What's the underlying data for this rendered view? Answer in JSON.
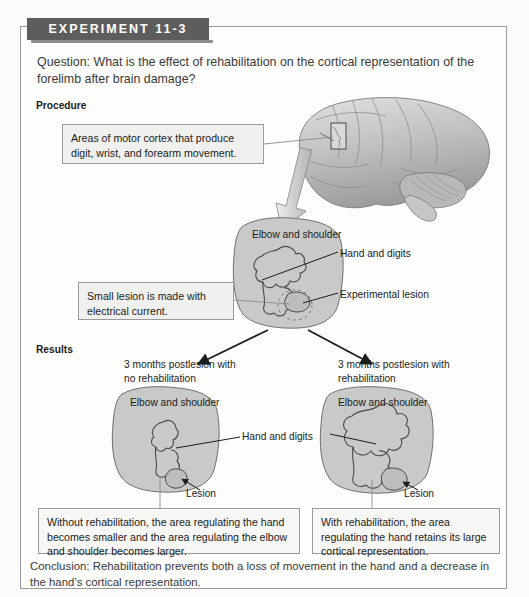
{
  "figure": {
    "banner_label": "EXPERIMENT 11-3",
    "question": "Question: What is the effect of rehabilitation on the cortical representation of the forelimb after brain damage?",
    "procedure_label": "Procedure",
    "results_label": "Results",
    "conclusion": "Conclusion: Rehabilitation prevents both a loss of movement in the hand and a decrease in the hand’s cortical representation."
  },
  "procedure": {
    "callout_motor_cortex": "Areas of motor cortex that produce digit, wrist, and forearm movement.",
    "callout_small_lesion": "Small lesion is made with electrical current.",
    "map": {
      "title": "Elbow and shoulder",
      "label_hand_digits": "Hand and digits",
      "label_experimental_lesion": "Experimental lesion"
    }
  },
  "results": {
    "branch_left": "3 months postlesion with no rehabilitation",
    "branch_right": "3 months postlesion with rehabilitation",
    "shared_label_hand_digits": "Hand and digits",
    "left_map": {
      "title": "Elbow and shoulder",
      "label_lesion": "Lesion"
    },
    "right_map": {
      "title": "Elbow and shoulder",
      "label_lesion": "Lesion"
    },
    "callout_no_rehab": "Without rehabilitation, the area regulating the hand becomes smaller and the area regulating the elbow and shoulder becomes larger.",
    "callout_rehab": "With rehabilitation, the area regulating the hand retains its large cortical representation."
  },
  "colors": {
    "banner": "#5d5d5d",
    "map_fill": "#c9c9c9",
    "callout_fill": "#f0f0ee",
    "border": "#9a9a9a",
    "text": "#231f20"
  }
}
